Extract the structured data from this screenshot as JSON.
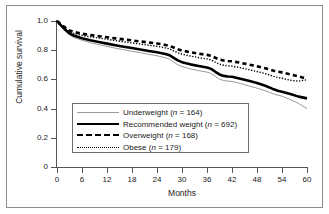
{
  "figure": {
    "x_axis_title": "Months",
    "y_axis_title": "Cumulative survival"
  },
  "legend": {
    "items": [
      {
        "label": "Underweight (n = 164)",
        "style": "thin-solid-gray"
      },
      {
        "label": "Recommended weight (n = 692)",
        "style": "thick-solid-black"
      },
      {
        "label": "Overweight (n = 168)",
        "style": "thick-dashed-black"
      },
      {
        "label": "Obese (n = 179)",
        "style": "thin-dotted-black"
      }
    ]
  },
  "chart_data": {
    "type": "line",
    "title": "",
    "subtitle": "",
    "xlabel": "Months",
    "ylabel": "Cumulative survival",
    "xlim": [
      0,
      60
    ],
    "ylim": [
      0,
      1.0
    ],
    "xticks": [
      0,
      6,
      12,
      18,
      24,
      30,
      36,
      42,
      48,
      54,
      60
    ],
    "xtick_labels": [
      "0",
      "6",
      "12",
      "18",
      "24",
      "30",
      "36",
      "42",
      "48",
      "54",
      "60"
    ],
    "yticks": [
      0,
      0.2,
      0.4,
      0.6,
      0.8,
      1.0
    ],
    "ytick_labels": [
      "0",
      "0.2",
      "0.4",
      "0.6",
      "0.8",
      "1.0"
    ],
    "grid": false,
    "legend_position": "lower-center-inside",
    "x": [
      0,
      1,
      2,
      3,
      4,
      6,
      8,
      10,
      12,
      14,
      16,
      18,
      20,
      22,
      24,
      26,
      27,
      28,
      29,
      30,
      31,
      32,
      34,
      36,
      37,
      38,
      39,
      40,
      41,
      42,
      44,
      46,
      48,
      50,
      51,
      52,
      53,
      54,
      56,
      58,
      60
    ],
    "series": [
      {
        "name": "Underweight",
        "n": 164,
        "color": "#9a9a9a",
        "line_style": "solid",
        "line_width": 1,
        "values": [
          1.0,
          0.965,
          0.935,
          0.905,
          0.888,
          0.868,
          0.852,
          0.838,
          0.826,
          0.814,
          0.803,
          0.793,
          0.783,
          0.772,
          0.762,
          0.748,
          0.738,
          0.718,
          0.7,
          0.688,
          0.68,
          0.672,
          0.66,
          0.65,
          0.64,
          0.621,
          0.602,
          0.592,
          0.588,
          0.586,
          0.572,
          0.556,
          0.54,
          0.522,
          0.512,
          0.5,
          0.492,
          0.485,
          0.462,
          0.435,
          0.4
        ]
      },
      {
        "name": "Recommended weight",
        "n": 692,
        "color": "#000000",
        "line_style": "solid",
        "line_width": 2.6,
        "values": [
          1.0,
          0.968,
          0.94,
          0.915,
          0.9,
          0.882,
          0.868,
          0.856,
          0.845,
          0.834,
          0.824,
          0.815,
          0.805,
          0.795,
          0.786,
          0.774,
          0.766,
          0.748,
          0.73,
          0.718,
          0.71,
          0.703,
          0.692,
          0.682,
          0.672,
          0.652,
          0.634,
          0.624,
          0.62,
          0.618,
          0.605,
          0.59,
          0.575,
          0.556,
          0.545,
          0.532,
          0.522,
          0.516,
          0.5,
          0.482,
          0.47
        ]
      },
      {
        "name": "Overweight",
        "n": 168,
        "color": "#000000",
        "line_style": "dashed",
        "line_width": 2.6,
        "values": [
          1.0,
          0.975,
          0.955,
          0.935,
          0.925,
          0.913,
          0.904,
          0.896,
          0.889,
          0.881,
          0.874,
          0.867,
          0.86,
          0.853,
          0.846,
          0.836,
          0.83,
          0.818,
          0.806,
          0.798,
          0.792,
          0.786,
          0.776,
          0.768,
          0.762,
          0.748,
          0.736,
          0.729,
          0.726,
          0.724,
          0.714,
          0.702,
          0.69,
          0.676,
          0.668,
          0.66,
          0.653,
          0.648,
          0.634,
          0.62,
          0.605
        ]
      },
      {
        "name": "Obese",
        "n": 179,
        "color": "#000000",
        "line_style": "dotted",
        "line_width": 1.4,
        "values": [
          1.0,
          0.972,
          0.948,
          0.926,
          0.915,
          0.902,
          0.892,
          0.883,
          0.875,
          0.866,
          0.858,
          0.85,
          0.842,
          0.834,
          0.827,
          0.816,
          0.809,
          0.795,
          0.782,
          0.773,
          0.766,
          0.76,
          0.749,
          0.74,
          0.733,
          0.718,
          0.704,
          0.697,
          0.693,
          0.691,
          0.68,
          0.667,
          0.654,
          0.639,
          0.63,
          0.621,
          0.613,
          0.608,
          0.594,
          0.588,
          0.598
        ]
      }
    ]
  }
}
